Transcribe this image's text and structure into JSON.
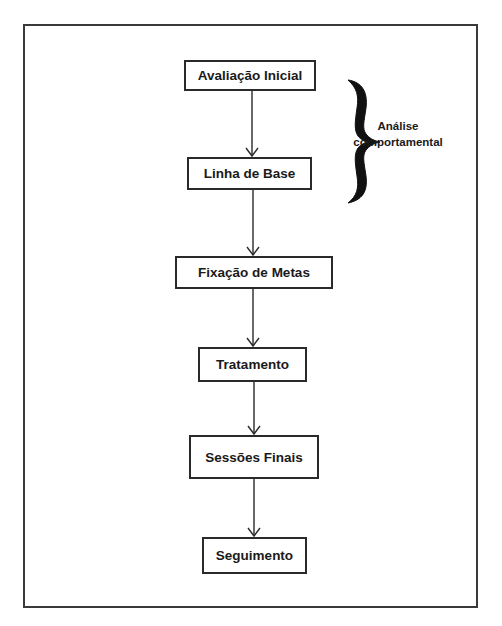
{
  "diagram": {
    "type": "flowchart",
    "direction": "top-to-bottom",
    "nodes": [
      {
        "id": "n1",
        "label": "Avaliação Inicial"
      },
      {
        "id": "n2",
        "label": "Linha de Base"
      },
      {
        "id": "n3",
        "label": "Fixação de Metas"
      },
      {
        "id": "n4",
        "label": "Tratamento"
      },
      {
        "id": "n5",
        "label": "Sessões Finais"
      },
      {
        "id": "n6",
        "label": "Seguimento"
      }
    ],
    "edges": [
      {
        "from": "n1",
        "to": "n2"
      },
      {
        "from": "n2",
        "to": "n3"
      },
      {
        "from": "n3",
        "to": "n4"
      },
      {
        "from": "n4",
        "to": "n5"
      },
      {
        "from": "n5",
        "to": "n6"
      }
    ],
    "group": {
      "brace": "right-curly-brace",
      "spans": [
        "n1",
        "n2"
      ],
      "label_line1": "Análise",
      "label_line2": "comportamental"
    }
  }
}
